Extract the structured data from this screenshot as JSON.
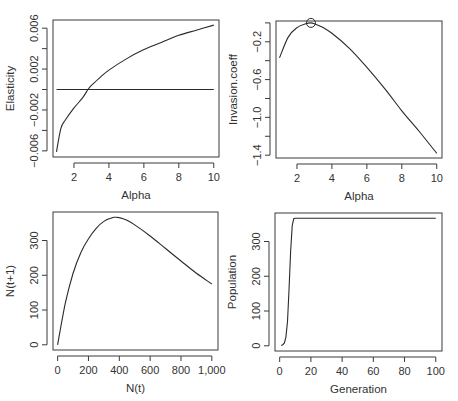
{
  "chart_data": [
    {
      "id": "elasticity",
      "type": "line",
      "title": "",
      "xlabel": "Alpha",
      "ylabel": "Elasticity",
      "xlim": [
        0.8,
        10.3
      ],
      "ylim": [
        -0.0066,
        0.0068
      ],
      "xticks": [
        2,
        4,
        6,
        8,
        10
      ],
      "xtick_labels": [
        "2",
        "4",
        "6",
        "8",
        "10"
      ],
      "yticks": [
        -0.006,
        -0.004,
        -0.002,
        0.0,
        0.002,
        0.004,
        0.006
      ],
      "ytick_labels": [
        "-0.006",
        "",
        "-0.002",
        "",
        "0.002",
        "",
        "0.006"
      ],
      "grid": false,
      "box_px": {
        "x0": 53,
        "y0": 20,
        "x1": 219,
        "y1": 157
      },
      "series": [
        {
          "name": "elasticity",
          "x": [
            1.0,
            1.25,
            1.5,
            2.0,
            2.5,
            2.8,
            3.0,
            3.5,
            4.0,
            5.0,
            6.0,
            7.0,
            8.0,
            9.0,
            10.0
          ],
          "y": [
            -0.0061,
            -0.0038,
            -0.003,
            -0.0018,
            -0.0008,
            0.0,
            0.0004,
            0.0012,
            0.0019,
            0.003,
            0.0039,
            0.0046,
            0.0053,
            0.0058,
            0.0063
          ]
        },
        {
          "name": "zero-line",
          "x": [
            1.0,
            10.0
          ],
          "y": [
            0.0,
            0.0
          ]
        }
      ]
    },
    {
      "id": "invasion",
      "type": "line",
      "title": "",
      "xlabel": "Alpha",
      "ylabel": "Invasion.coeff",
      "xlim": [
        0.8,
        10.3
      ],
      "ylim": [
        -1.43,
        0.02
      ],
      "xticks": [
        2,
        4,
        6,
        8,
        10
      ],
      "xtick_labels": [
        "2",
        "4",
        "6",
        "8",
        "10"
      ],
      "yticks": [
        0.0,
        -0.2,
        -0.4,
        -0.6,
        -0.8,
        -1.0,
        -1.2,
        -1.4
      ],
      "ytick_labels": [
        "",
        "-0.2",
        "",
        "-0.6",
        "",
        "-1.0",
        "",
        "-1.4"
      ],
      "grid": false,
      "box_px": {
        "x0": 276,
        "y0": 21,
        "x1": 442,
        "y1": 158
      },
      "series": [
        {
          "name": "invasion.coeff",
          "x": [
            1.0,
            1.5,
            2.0,
            2.5,
            2.8,
            3.0,
            3.5,
            4.0,
            5.0,
            6.0,
            7.0,
            8.0,
            9.0,
            10.0
          ],
          "y": [
            -0.37,
            -0.15,
            -0.05,
            -0.01,
            0.0,
            -0.01,
            -0.05,
            -0.11,
            -0.27,
            -0.47,
            -0.69,
            -0.93,
            -1.15,
            -1.38
          ]
        }
      ],
      "annotations": [
        {
          "type": "circle-marker",
          "x": 2.8,
          "y": 0.0
        }
      ]
    },
    {
      "id": "recruitment",
      "type": "line",
      "title": "",
      "xlabel": "N(t)",
      "ylabel": "N(t+1)",
      "xlim": [
        -30,
        1040
      ],
      "ylim": [
        -15,
        382
      ],
      "xticks": [
        0,
        200,
        400,
        600,
        800,
        1000
      ],
      "xtick_labels": [
        "0",
        "200",
        "400",
        "600",
        "800",
        "1,000"
      ],
      "yticks": [
        0,
        100,
        200,
        300
      ],
      "ytick_labels": [
        "0",
        "100",
        "200",
        "300"
      ],
      "grid": false,
      "box_px": {
        "x0": 53,
        "y0": 212,
        "x1": 218,
        "y1": 350
      },
      "series": [
        {
          "name": "N(t+1)",
          "x": [
            0,
            50,
            100,
            150,
            200,
            250,
            300,
            350,
            370,
            400,
            450,
            500,
            600,
            700,
            800,
            900,
            1000
          ],
          "y": [
            0,
            120,
            205,
            265,
            305,
            335,
            355,
            365,
            367,
            366,
            358,
            345,
            313,
            277,
            241,
            206,
            175
          ]
        }
      ]
    },
    {
      "id": "population",
      "type": "line",
      "title": "",
      "xlabel": "Generation",
      "ylabel": "Population",
      "xlim": [
        -3,
        104
      ],
      "ylim": [
        -15,
        382
      ],
      "xticks": [
        0,
        20,
        40,
        60,
        80,
        100
      ],
      "xtick_labels": [
        "0",
        "20",
        "40",
        "60",
        "80",
        "100"
      ],
      "yticks": [
        0,
        100,
        200,
        300
      ],
      "ytick_labels": [
        "0",
        "100",
        "200",
        "300"
      ],
      "grid": false,
      "box_px": {
        "x0": 275,
        "y0": 213,
        "x1": 442,
        "y1": 351
      },
      "series": [
        {
          "name": "population",
          "x": [
            1,
            2,
            3,
            4,
            5,
            6,
            7,
            8,
            9,
            10,
            20,
            40,
            60,
            80,
            100
          ],
          "y": [
            1,
            3,
            8,
            25,
            70,
            160,
            270,
            345,
            366,
            367,
            367,
            367,
            367,
            367,
            367
          ]
        }
      ]
    }
  ]
}
